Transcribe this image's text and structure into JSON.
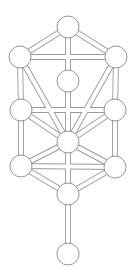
{
  "diagram": {
    "type": "tree-of-life",
    "colors": {
      "background": "#ffffff",
      "line": "#9a9a9a",
      "node_stroke": "#8a8a8a",
      "node_fill": "#ffffff"
    },
    "node_radius": 11,
    "nodes": [
      {
        "id": "n1",
        "x": 68,
        "y": 27
      },
      {
        "id": "n2",
        "x": 116,
        "y": 57
      },
      {
        "id": "n3",
        "x": 20,
        "y": 57
      },
      {
        "id": "n4",
        "x": 68,
        "y": 81
      },
      {
        "id": "n5",
        "x": 21,
        "y": 110
      },
      {
        "id": "n6",
        "x": 115,
        "y": 110
      },
      {
        "id": "n7",
        "x": 68,
        "y": 142
      },
      {
        "id": "n8",
        "x": 21,
        "y": 166
      },
      {
        "id": "n9",
        "x": 115,
        "y": 167
      },
      {
        "id": "n10",
        "x": 68,
        "y": 194
      },
      {
        "id": "n11",
        "x": 68,
        "y": 254
      }
    ],
    "edges": [
      [
        "n1",
        "n2"
      ],
      [
        "n1",
        "n3"
      ],
      [
        "n1",
        "n4"
      ],
      [
        "n2",
        "n3"
      ],
      [
        "n2",
        "n6"
      ],
      [
        "n2",
        "n7"
      ],
      [
        "n3",
        "n5"
      ],
      [
        "n3",
        "n7"
      ],
      [
        "n4",
        "n7"
      ],
      [
        "n5",
        "n6"
      ],
      [
        "n5",
        "n7"
      ],
      [
        "n5",
        "n8"
      ],
      [
        "n6",
        "n7"
      ],
      [
        "n6",
        "n9"
      ],
      [
        "n7",
        "n8"
      ],
      [
        "n7",
        "n9"
      ],
      [
        "n7",
        "n10"
      ],
      [
        "n8",
        "n9"
      ],
      [
        "n8",
        "n10"
      ],
      [
        "n9",
        "n10"
      ],
      [
        "n10",
        "n11"
      ]
    ]
  }
}
